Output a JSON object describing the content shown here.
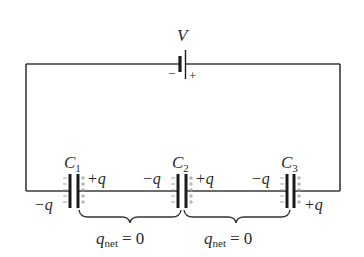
{
  "diagram": {
    "type": "series capacitor circuit",
    "battery": {
      "label": "V",
      "negative_sign": "−",
      "positive_sign": "+"
    },
    "capacitors": [
      {
        "name": "C",
        "sub": "1",
        "left_charge": "−q",
        "right_charge": "+q"
      },
      {
        "name": "C",
        "sub": "2",
        "left_charge": "−q",
        "right_charge": "+q"
      },
      {
        "name": "C",
        "sub": "3",
        "left_charge": "−q",
        "right_charge": "+q"
      }
    ],
    "braces": [
      {
        "q": "q",
        "sub": "net",
        "eq": "= 0"
      },
      {
        "q": "q",
        "sub": "net",
        "eq": "= 0"
      }
    ],
    "colors": {
      "wire": "#3a3a3a",
      "plate": "#1a1a1a",
      "text": "#2a2a2a",
      "charge_ticks": "#9a9a9a"
    }
  }
}
